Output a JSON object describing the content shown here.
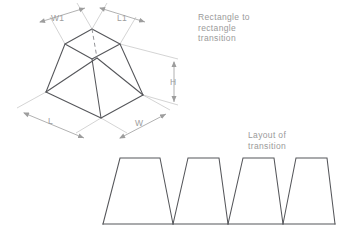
{
  "drawing": {
    "title": "Rectangle to rectangle transition",
    "background_color": "#ffffff",
    "line_color": "#55565a",
    "dimension_color": "#b6b6b6",
    "text_color": "#9a9a9a"
  },
  "notes": {
    "transition": "Rectangle to\nrectangle\ntransition",
    "layout": "Layout of\ntransition"
  },
  "dimensions": {
    "w1": "W1",
    "l1": "L1",
    "l": "L",
    "w": "W",
    "h": "H"
  },
  "frustum": {
    "name": "rectangular-frustum",
    "top_face": {
      "back": [
        92,
        29
      ],
      "left": [
        65,
        44
      ],
      "front": [
        92,
        59
      ],
      "right": [
        120,
        44
      ]
    },
    "bottom_face": {
      "back": [
        97,
        58
      ],
      "left": [
        46,
        92
      ],
      "front": [
        101,
        118
      ],
      "right": [
        143,
        95
      ]
    },
    "hidden_edge": "back-vertical"
  },
  "layout_shapes": {
    "type": "trapezoid-row",
    "count": 4,
    "baseline_y": 224,
    "top_y": 158,
    "trapezoids": [
      {
        "bottom_left": 103,
        "bottom_right": 173,
        "top_left": 120,
        "top_right": 160
      },
      {
        "bottom_left": 173,
        "bottom_right": 228,
        "top_left": 188,
        "top_right": 219
      },
      {
        "bottom_left": 228,
        "bottom_right": 283,
        "top_left": 243,
        "top_right": 274
      },
      {
        "bottom_left": 283,
        "bottom_right": 335,
        "top_left": 296,
        "top_right": 327
      }
    ]
  }
}
